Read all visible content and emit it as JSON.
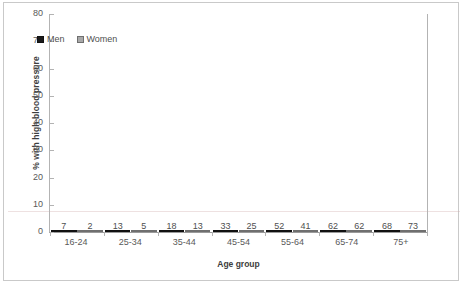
{
  "chart_data": {
    "type": "bar",
    "title": "",
    "subtitle": "",
    "xlabel": "Age group",
    "ylabel": "% with high blood pressure",
    "categories": [
      "16-24",
      "25-34",
      "35-44",
      "45-54",
      "55-64",
      "65-74",
      "75+"
    ],
    "series": [
      {
        "name": "Men",
        "color": "#1a1a1a",
        "values": [
          7,
          13,
          18,
          33,
          52,
          62,
          68
        ]
      },
      {
        "name": "Women",
        "color": "#a8a8a8",
        "values": [
          2,
          5,
          13,
          25,
          41,
          62,
          73
        ]
      }
    ],
    "ylim": [
      0,
      80
    ],
    "yticks": [
      0,
      10,
      20,
      30,
      40,
      50,
      60,
      70,
      80
    ],
    "ytick_labels": [
      "0",
      "10",
      "20",
      "30",
      "40",
      "50",
      "60",
      "70",
      "80"
    ],
    "grid": false,
    "legend_position": "upper-left-inside",
    "data_labels": true,
    "bar_labels": {
      "Men": [
        "7",
        "13",
        "18",
        "33",
        "52",
        "62",
        "68"
      ],
      "Women": [
        "2",
        "5",
        "13",
        "25",
        "41",
        "62",
        "73"
      ]
    }
  },
  "legend": {
    "entries": [
      {
        "label": "Men",
        "swatch": "men-color-swatch-icon"
      },
      {
        "label": "Women",
        "swatch": "women-color-swatch-icon"
      }
    ]
  },
  "axes": {
    "y_title": "% with high blood pressure",
    "x_title": "Age group"
  }
}
